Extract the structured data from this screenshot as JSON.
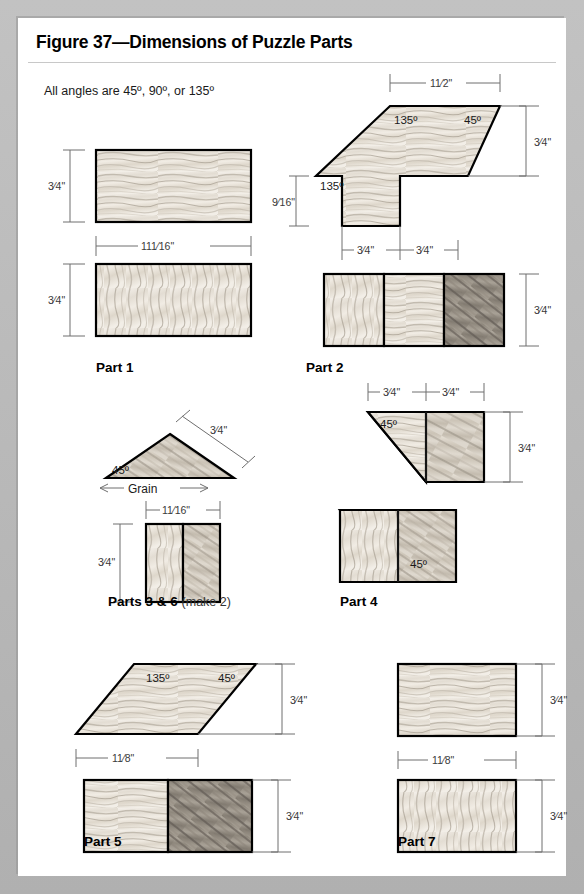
{
  "figure": {
    "title": "Figure 37—Dimensions of Puzzle Parts",
    "subtitle": "All angles are 45º, 90º, or 135º"
  },
  "colors": {
    "page_background": "#b3b3b3",
    "card_background": "#ffffff",
    "outline": "#000000",
    "dimension_line": "#6e6e6e",
    "wood_light": "#efeae2",
    "wood_mid": "#cfc8bd",
    "wood_dark": "#8e877c"
  },
  "labels": {
    "part1": "Part 1",
    "part2": "Part 2",
    "part3_6": "Parts 3 & 6",
    "part3_6_note": "(make 2)",
    "part4": "Part 4",
    "part5": "Part 5",
    "part7": "Part 7",
    "grain": "Grain"
  },
  "dimensions": {
    "three_quarter": "3/4\"",
    "one_and_eleven_sixteenths": "1 11/16\"",
    "one_and_one_sixteenth": "1 1/16\"",
    "one_and_half": "1 1/2\"",
    "one_and_eighth": "1 1/8\"",
    "nine_sixteenths": "9/16\""
  },
  "angles": {
    "a45": "45º",
    "a135": "135º",
    "a90": "90º"
  },
  "parts": [
    {
      "id": "part1",
      "label": "Part 1",
      "views": [
        {
          "view": "top",
          "shape": "rectangle",
          "width": "1 11/16\"",
          "height": "3/4\""
        },
        {
          "view": "edge",
          "shape": "rectangle",
          "width": "1 11/16\"",
          "height": "3/4\""
        }
      ]
    },
    {
      "id": "part2",
      "label": "Part 2",
      "views": [
        {
          "view": "top",
          "shape": "notched-polygon",
          "top_width": "1 1/2\"",
          "right_height": "3/4\"",
          "left_height": "9/16\"",
          "bottom_segments": [
            "3/4\"",
            "3/4\""
          ],
          "angles": [
            "135º",
            "45º",
            "135º"
          ]
        },
        {
          "view": "edge",
          "shape": "rectangle-3-segments",
          "height": "3/4\""
        }
      ]
    },
    {
      "id": "part3_6",
      "label": "Parts 3 & 6",
      "note": "(make 2)",
      "views": [
        {
          "view": "top",
          "shape": "triangle",
          "hypotenuse": "3/4\"",
          "angle": "45º",
          "grain": "Grain"
        },
        {
          "view": "edge",
          "shape": "rectangle-2-segments",
          "width": "1 1/16\"",
          "height": "3/4\""
        }
      ]
    },
    {
      "id": "part4",
      "label": "Part 4",
      "views": [
        {
          "view": "top",
          "shape": "trapezoid-left-bevel",
          "top_segments": [
            "3/4\"",
            "3/4\""
          ],
          "height": "3/4\"",
          "angle": "45º"
        },
        {
          "view": "edge",
          "shape": "trapezoid-right-bevel",
          "angle": "45º"
        }
      ]
    },
    {
      "id": "part5",
      "label": "Part 5",
      "views": [
        {
          "view": "top",
          "shape": "parallelogram",
          "base": "1 1/8\"",
          "height": "3/4\"",
          "angles": [
            "135º",
            "45º"
          ]
        },
        {
          "view": "edge",
          "shape": "rectangle-2-segments",
          "height": "3/4\""
        }
      ]
    },
    {
      "id": "part7",
      "label": "Part 7",
      "views": [
        {
          "view": "top",
          "shape": "rectangle",
          "width": "1 1/8\"",
          "height": "3/4\""
        },
        {
          "view": "edge",
          "shape": "rectangle",
          "height": "3/4\""
        }
      ]
    }
  ]
}
